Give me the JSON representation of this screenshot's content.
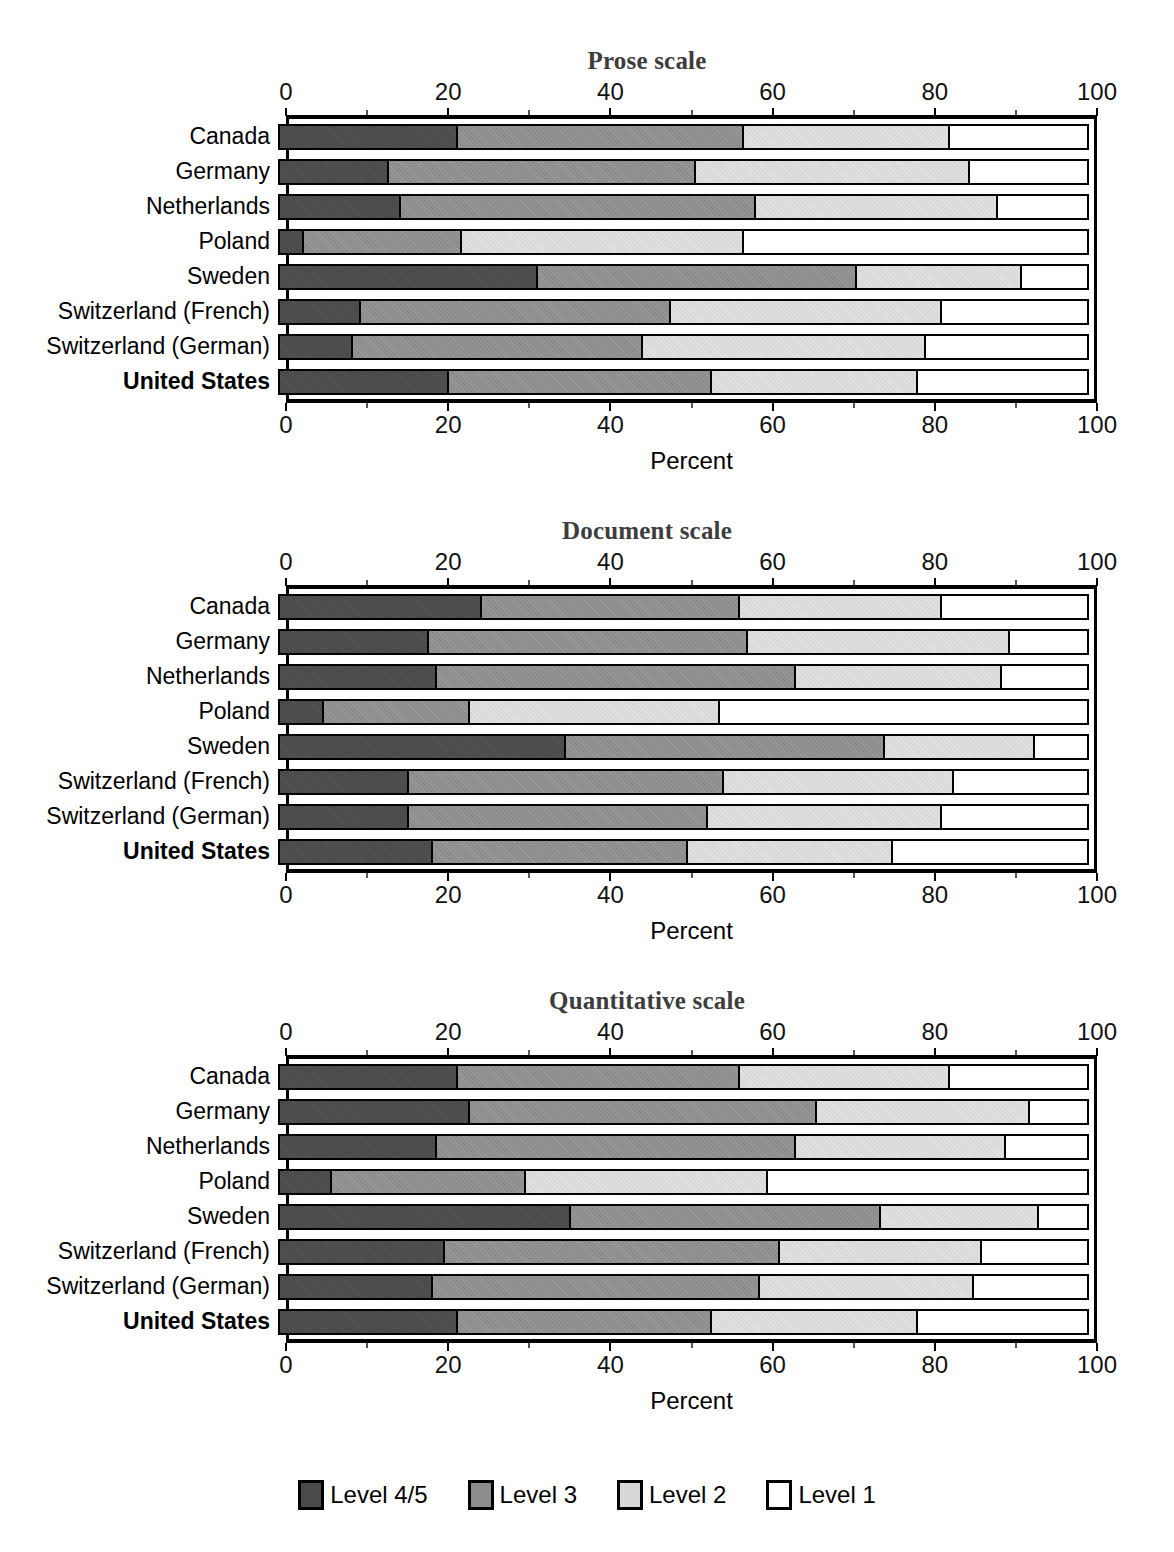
{
  "axis": {
    "ticks": [
      0,
      20,
      40,
      60,
      80,
      100
    ],
    "tick_labels": [
      "0",
      "20",
      "40",
      "60",
      "80",
      "100"
    ],
    "xlabel": "Percent",
    "range": [
      0,
      100
    ]
  },
  "legend": {
    "position": "bottom-center",
    "items": [
      {
        "label": "Level 4/5",
        "color": "#4a4a4a"
      },
      {
        "label": "Level 3",
        "color": "#8c8c8c"
      },
      {
        "label": "Level 2",
        "color": "#d8d8d8"
      },
      {
        "label": "Level 1",
        "color": "#ffffff"
      }
    ]
  },
  "countries": [
    "Canada",
    "Germany",
    "Netherlands",
    "Poland",
    "Sweden",
    "Switzerland (French)",
    "Switzerland (German)",
    "United States"
  ],
  "highlight_country": "United States",
  "panels": [
    {
      "title": "Prose scale"
    },
    {
      "title": "Document scale"
    },
    {
      "title": "Quantitative scale"
    }
  ],
  "chart_data": [
    {
      "type": "bar",
      "orientation": "horizontal",
      "stacked": true,
      "title": "Prose scale",
      "xlabel": "Percent",
      "ylabel": "",
      "xlim": [
        0,
        100
      ],
      "grid": false,
      "categories": [
        "Canada",
        "Germany",
        "Netherlands",
        "Poland",
        "Sweden",
        "Switzerland (French)",
        "Switzerland (German)",
        "United States"
      ],
      "series": [
        {
          "name": "Level 4/5",
          "values": [
            22.0,
            13.5,
            15.0,
            3.0,
            32.0,
            10.0,
            9.0,
            21.0
          ]
        },
        {
          "name": "Level 3",
          "values": [
            35.5,
            38.0,
            44.0,
            19.5,
            39.5,
            38.5,
            36.0,
            32.5
          ]
        },
        {
          "name": "Level 2",
          "values": [
            25.5,
            34.0,
            30.0,
            35.0,
            20.5,
            33.5,
            35.0,
            25.5
          ]
        },
        {
          "name": "Level 1",
          "values": [
            17.0,
            14.5,
            11.0,
            42.5,
            8.0,
            18.0,
            20.0,
            21.0
          ]
        }
      ],
      "cumulative_boundaries": [
        [
          22.0,
          57.5,
          83.0
        ],
        [
          13.5,
          51.5,
          85.5
        ],
        [
          15.0,
          59.0,
          89.0
        ],
        [
          3.0,
          22.5,
          57.5
        ],
        [
          32.0,
          71.5,
          92.0
        ],
        [
          10.0,
          48.5,
          82.0
        ],
        [
          9.0,
          45.0,
          80.0
        ],
        [
          21.0,
          53.5,
          79.0
        ]
      ]
    },
    {
      "type": "bar",
      "orientation": "horizontal",
      "stacked": true,
      "title": "Document scale",
      "xlabel": "Percent",
      "ylabel": "",
      "xlim": [
        0,
        100
      ],
      "grid": false,
      "categories": [
        "Canada",
        "Germany",
        "Netherlands",
        "Poland",
        "Sweden",
        "Switzerland (French)",
        "Switzerland (German)",
        "United States"
      ],
      "series": [
        {
          "name": "Level 4/5",
          "values": [
            25.0,
            18.5,
            19.5,
            5.5,
            35.5,
            16.0,
            16.0,
            19.0
          ]
        },
        {
          "name": "Level 3",
          "values": [
            32.0,
            39.5,
            44.5,
            18.0,
            39.5,
            39.0,
            37.0,
            31.5
          ]
        },
        {
          "name": "Level 2",
          "values": [
            25.0,
            32.5,
            25.5,
            31.0,
            18.5,
            28.5,
            29.0,
            25.5
          ]
        },
        {
          "name": "Level 1",
          "values": [
            18.0,
            9.5,
            10.5,
            45.5,
            6.5,
            16.5,
            18.0,
            24.0
          ]
        }
      ],
      "cumulative_boundaries": [
        [
          25.0,
          57.0,
          82.0
        ],
        [
          18.5,
          58.0,
          90.5
        ],
        [
          19.5,
          64.0,
          89.5
        ],
        [
          5.5,
          23.5,
          54.5
        ],
        [
          35.5,
          75.0,
          93.5
        ],
        [
          16.0,
          55.0,
          83.5
        ],
        [
          16.0,
          53.0,
          82.0
        ],
        [
          19.0,
          50.5,
          76.0
        ]
      ]
    },
    {
      "type": "bar",
      "orientation": "horizontal",
      "stacked": true,
      "title": "Quantitative scale",
      "xlabel": "Percent",
      "ylabel": "",
      "xlim": [
        0,
        100
      ],
      "grid": false,
      "categories": [
        "Canada",
        "Germany",
        "Netherlands",
        "Poland",
        "Sweden",
        "Switzerland (French)",
        "Switzerland (German)",
        "United States"
      ],
      "series": [
        {
          "name": "Level 4/5",
          "values": [
            22.0,
            23.5,
            19.5,
            6.5,
            36.0,
            20.5,
            19.0,
            22.0
          ]
        },
        {
          "name": "Level 3",
          "values": [
            35.0,
            43.0,
            44.5,
            24.0,
            38.5,
            41.5,
            40.5,
            31.5
          ]
        },
        {
          "name": "Level 2",
          "values": [
            26.0,
            26.5,
            26.0,
            30.0,
            19.5,
            25.0,
            26.5,
            25.5
          ]
        },
        {
          "name": "Level 1",
          "values": [
            17.0,
            7.0,
            10.0,
            39.5,
            6.0,
            13.0,
            14.0,
            21.0
          ]
        }
      ],
      "cumulative_boundaries": [
        [
          22.0,
          57.0,
          83.0
        ],
        [
          23.5,
          66.5,
          93.0
        ],
        [
          19.5,
          64.0,
          90.0
        ],
        [
          6.5,
          30.5,
          60.5
        ],
        [
          36.0,
          74.5,
          94.0
        ],
        [
          20.5,
          62.0,
          87.0
        ],
        [
          19.0,
          59.5,
          86.0
        ],
        [
          22.0,
          53.5,
          79.0
        ]
      ]
    }
  ]
}
